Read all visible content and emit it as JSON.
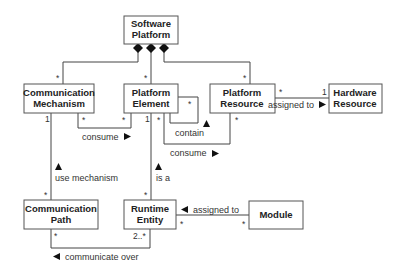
{
  "diagram": {
    "type": "uml-class-diagram",
    "classes": {
      "software_platform": [
        "Software",
        "Platform"
      ],
      "communication_mechanism": [
        "Communication",
        "Mechanism"
      ],
      "platform_element": [
        "Platform",
        "Element"
      ],
      "platform_resource": [
        "Platform",
        "Resource"
      ],
      "hardware_resource": [
        "Hardware",
        "Resource"
      ],
      "communication_path": [
        "Communication",
        "Path"
      ],
      "runtime_entity": [
        "Runtime",
        "Entity"
      ],
      "module": [
        "Module"
      ]
    },
    "associations": {
      "compositions": [
        {
          "from": "Software Platform",
          "to": "Communication Mechanism",
          "target_multiplicity": "*"
        },
        {
          "from": "Software Platform",
          "to": "Platform Element",
          "target_multiplicity": "*"
        },
        {
          "from": "Software Platform",
          "to": "Platform Resource",
          "target_multiplicity": "*"
        }
      ],
      "consume_mech": {
        "label": "consume",
        "from": "Platform Element",
        "to": "Communication Mechanism",
        "from_mult": "*",
        "to_mult": "*",
        "direction": "right"
      },
      "contain": {
        "label": "contain",
        "from": "Platform Element",
        "to": "Platform Element",
        "mult": "*",
        "direction": "up"
      },
      "consume_res": {
        "label": "consume",
        "from": "Platform Element",
        "to": "Platform Resource",
        "from_mult": "*",
        "to_mult": "*",
        "direction": "right"
      },
      "assigned_hw": {
        "label": "assigned to",
        "from": "Platform Resource",
        "to": "Hardware Resource",
        "from_mult": "*",
        "to_mult": "1",
        "direction": "right"
      },
      "use_mechanism": {
        "label": "use mechanism",
        "from": "Communication Path",
        "to": "Communication Mechanism",
        "from_mult": "*",
        "to_mult": "1",
        "direction": "up"
      },
      "is_a": {
        "label": "is a",
        "from": "Runtime Entity",
        "to": "Platform Element",
        "from_mult": "*",
        "to_mult": "1",
        "direction": "up"
      },
      "assigned_module": {
        "label": "assigned to",
        "from": "Module",
        "to": "Runtime Entity",
        "from_mult": "*",
        "to_mult": "*",
        "direction": "left"
      },
      "communicate_over": {
        "label": "communicate over",
        "from": "Runtime Entity",
        "to": "Communication Path",
        "from_mult": "2..*",
        "to_mult": "*",
        "direction": "left"
      }
    }
  }
}
